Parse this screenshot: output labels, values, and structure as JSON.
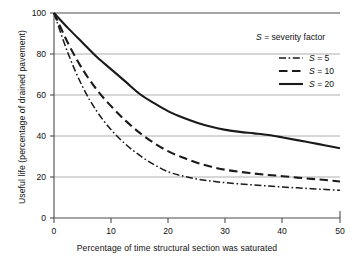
{
  "chart_data": {
    "type": "line",
    "title": "",
    "xlabel": "Percentage of time structural section was saturated",
    "ylabel": "Useful life (percentage of drained pavement)",
    "xlim": [
      0,
      50
    ],
    "ylim": [
      0,
      100
    ],
    "xticks": [
      "0",
      "10",
      "20",
      "30",
      "40",
      "50"
    ],
    "yticks": [
      "0",
      "20",
      "40",
      "60",
      "80",
      "100"
    ],
    "grid": "horizontal gridlines at y = 20, 40, 60, 80, 100",
    "legend_position": "upper right, inside plot area",
    "legend_title": "S = severity factor",
    "x": [
      0,
      2.5,
      5,
      7.5,
      10,
      12.5,
      15,
      17.5,
      20,
      22.5,
      25,
      27.5,
      30,
      32.5,
      35,
      37.5,
      40,
      42.5,
      45,
      47.5,
      50
    ],
    "series": [
      {
        "name": "S = 5",
        "label_symbol": "S",
        "label_value": "5",
        "linestyle": "dashdot",
        "color": "#1a1a1a",
        "values": [
          100,
          80,
          64,
          52,
          43,
          36,
          30.5,
          26,
          22.5,
          20.5,
          19,
          18,
          17.2,
          16.6,
          16.1,
          15.6,
          15.1,
          14.7,
          14.3,
          13.9,
          13.5
        ]
      },
      {
        "name": "S = 10",
        "label_symbol": "S",
        "label_value": "10",
        "linestyle": "dashed",
        "color": "#1a1a1a",
        "values": [
          100,
          85,
          72.5,
          62.5,
          54.5,
          47.5,
          41.5,
          36.5,
          32.5,
          29.5,
          27,
          25,
          23.5,
          22.5,
          21.7,
          21,
          20.4,
          19.7,
          19.1,
          18.5,
          17.8
        ]
      },
      {
        "name": "S = 20",
        "label_symbol": "S",
        "label_value": "20",
        "linestyle": "solid",
        "color": "#1a1a1a",
        "values": [
          100,
          92.5,
          85.5,
          78.5,
          72.5,
          66.5,
          60.5,
          56,
          52,
          49,
          46.5,
          44.5,
          43,
          42,
          41.3,
          40.5,
          39.3,
          38,
          36.7,
          35.4,
          34
        ]
      }
    ]
  },
  "legend": {
    "title_symbol": "S",
    "title_text": "= severity factor",
    "items": [
      {
        "symbol": "S",
        "equals_value": "= 5"
      },
      {
        "symbol": "S",
        "equals_value": "= 10"
      },
      {
        "symbol": "S",
        "equals_value": "= 20"
      }
    ]
  },
  "axes": {
    "x_title": "Percentage of time structural section was saturated",
    "y_title": "Useful life (percentage of drained pavement)",
    "x_tick_labels": [
      "0",
      "10",
      "20",
      "30",
      "40",
      "50"
    ],
    "y_tick_labels": [
      "0",
      "20",
      "40",
      "60",
      "80",
      "100"
    ]
  }
}
